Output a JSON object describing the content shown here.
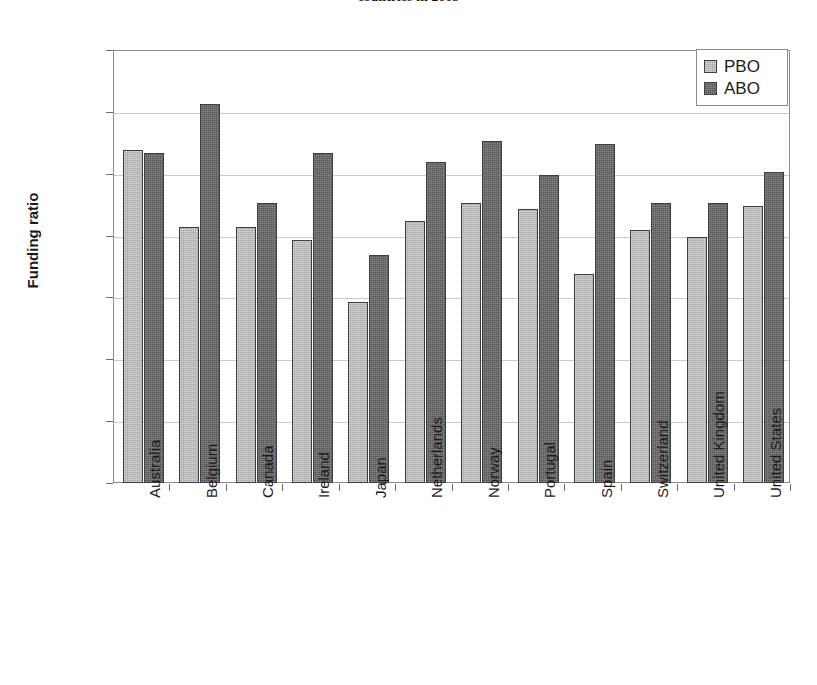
{
  "chart_data": {
    "type": "bar",
    "title": "countries in 2005",
    "xlabel": "",
    "ylabel": "Funding ratio",
    "ylim": [
      0.0,
      1.4
    ],
    "ytick_labels": [
      "1.4",
      "1.2",
      "1.0",
      "0.8",
      "0.6",
      "0.4",
      "0.2",
      "0.0"
    ],
    "ytick_values": [
      1.4,
      1.2,
      1.0,
      0.8,
      0.6,
      0.4,
      0.2,
      0.0
    ],
    "grid": true,
    "legend_position": "top-right",
    "categories": [
      "Australia",
      "Belgium",
      "Canada",
      "Ireland",
      "Japan",
      "Netherlands",
      "Norway",
      "Portugal",
      "Spain",
      "Switzerland",
      "United Kingdom",
      "United States"
    ],
    "series": [
      {
        "name": "PBO",
        "color": "#a9a9a9",
        "values": [
          1.08,
          0.83,
          0.83,
          0.79,
          0.59,
          0.85,
          0.91,
          0.89,
          0.68,
          0.82,
          0.8,
          0.9
        ]
      },
      {
        "name": "ABO",
        "color": "#565656",
        "values": [
          1.07,
          1.23,
          0.91,
          1.07,
          0.74,
          1.04,
          1.11,
          1.0,
          1.1,
          0.91,
          0.91,
          1.01
        ]
      }
    ]
  },
  "legend": {
    "items": [
      {
        "label": "PBO",
        "swatch": "pbo"
      },
      {
        "label": "ABO",
        "swatch": "abo"
      }
    ]
  }
}
